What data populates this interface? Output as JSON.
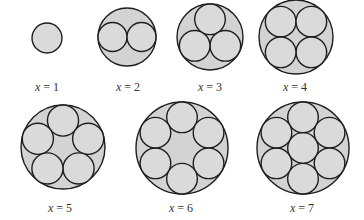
{
  "figure": {
    "fill_outer": "#d3d3d3",
    "fill_inner": "#dadada",
    "stroke": "#1e1e1e",
    "diagrams": [
      {
        "x": 1,
        "label_var": "x",
        "label_rest": " = 1",
        "cx": 47,
        "cy": 38,
        "R": 15,
        "label_x": 47,
        "label_y": 81
      },
      {
        "x": 2,
        "label_var": "x",
        "label_rest": " = 2",
        "cx": 127,
        "cy": 37,
        "R": 29,
        "label_x": 128,
        "label_y": 81
      },
      {
        "x": 3,
        "label_var": "x",
        "label_rest": " = 3",
        "cx": 210,
        "cy": 37,
        "R": 33,
        "label_x": 210,
        "label_y": 81
      },
      {
        "x": 4,
        "label_var": "x",
        "label_rest": " = 4",
        "cx": 296,
        "cy": 37,
        "R": 37,
        "label_x": 295,
        "label_y": 81
      },
      {
        "x": 5,
        "label_var": "x",
        "label_rest": " = 5",
        "cx": 63,
        "cy": 147,
        "R": 42,
        "label_x": 60,
        "label_y": 202
      },
      {
        "x": 6,
        "label_var": "x",
        "label_rest": " = 6",
        "cx": 182,
        "cy": 148,
        "R": 46,
        "label_x": 181,
        "label_y": 202
      },
      {
        "x": 7,
        "label_var": "x",
        "label_rest": " = 7",
        "cx": 303,
        "cy": 148,
        "R": 46,
        "label_x": 302,
        "label_y": 202
      }
    ]
  }
}
